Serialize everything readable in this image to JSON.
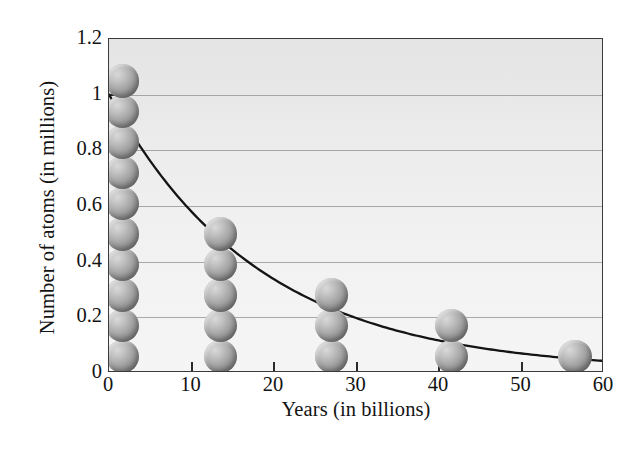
{
  "chart_data": {
    "type": "scatter",
    "title": "",
    "xlabel": "Years (in billions)",
    "ylabel": "Number of atoms (in millions)",
    "xlim": [
      0,
      60
    ],
    "ylim": [
      0,
      1.2
    ],
    "xticks": [
      0,
      10,
      20,
      30,
      40,
      50,
      60
    ],
    "xtick_labels": [
      "0",
      "10",
      "20",
      "30",
      "40",
      "50",
      "60"
    ],
    "yticks": [
      0,
      0.2,
      0.4,
      0.6,
      0.8,
      1,
      1.2
    ],
    "ytick_labels": [
      "0",
      "0.2",
      "0.4",
      "0.6",
      "0.8",
      "1",
      "1.2"
    ],
    "grid": "horizontal",
    "legend": "none",
    "panel_background": "#eeeeee",
    "series": [
      {
        "name": "Atoms remaining (stacked spheres)",
        "marker": "sphere-stack",
        "points": [
          {
            "x": 1.6,
            "y": 1.0,
            "atoms": 10
          },
          {
            "x": 13.5,
            "y": 0.5,
            "atoms": 5
          },
          {
            "x": 27.0,
            "y": 0.3,
            "atoms": 3
          },
          {
            "x": 41.5,
            "y": 0.2,
            "atoms": 2
          },
          {
            "x": 56.5,
            "y": 0.1,
            "atoms": 1
          }
        ]
      },
      {
        "name": "Exponential decay curve",
        "marker": "line",
        "color": "#1a1a1a",
        "model": "y = 1.0 * exp(-x / 18.2)",
        "x": [
          0,
          5,
          10,
          13.5,
          20,
          27,
          30,
          35,
          41.5,
          50,
          56.5,
          60
        ],
        "y": [
          1.0,
          0.76,
          0.58,
          0.48,
          0.335,
          0.225,
          0.19,
          0.145,
          0.105,
          0.065,
          0.05,
          0.043
        ]
      }
    ]
  },
  "axes": {
    "y_title": "Number of atoms (in millions)",
    "x_title": "Years (in billions)"
  }
}
